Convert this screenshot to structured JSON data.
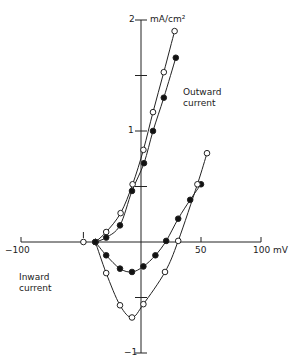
{
  "chart_data": {
    "type": "line",
    "title": "",
    "xlabel": "mV",
    "ylabel": "mA/cm2",
    "xlim": [
      -100,
      100
    ],
    "ylim": [
      -1,
      2
    ],
    "grid": false,
    "x_ticks": [
      {
        "value": -100,
        "label": "-100"
      },
      {
        "value": 50,
        "label": "50"
      },
      {
        "value": 100,
        "label": "100 mV"
      }
    ],
    "y_ticks": [
      {
        "value": 2,
        "label": "2"
      },
      {
        "value": 1.5,
        "label": ""
      },
      {
        "value": 1,
        "label": "1"
      },
      {
        "value": 0.5,
        "label": ""
      },
      {
        "value": -0.5,
        "label": ""
      },
      {
        "value": -1,
        "label": "-1"
      }
    ],
    "y_unit_label": "mA/cm²",
    "annotations": [
      {
        "text": "Outward",
        "line2": "current"
      },
      {
        "text": "Inward",
        "line2": "current"
      }
    ],
    "series": [
      {
        "name": "steady-state outward (open)",
        "marker": "open",
        "x": [
          -38,
          -29,
          -17,
          -7,
          2,
          10,
          19,
          28
        ],
        "y": [
          0,
          0.09,
          0.26,
          0.52,
          0.83,
          1.17,
          1.53,
          1.9
        ]
      },
      {
        "name": "steady-state outward (filled)",
        "marker": "filled",
        "x": [
          -38,
          -29,
          -17.5,
          -7.5,
          2.5,
          10,
          19,
          29
        ],
        "y": [
          0,
          0.04,
          0.15,
          0.46,
          0.71,
          1.0,
          1.3,
          1.66
        ]
      },
      {
        "name": "peak inward (filled)",
        "marker": "filled",
        "x": [
          -38,
          -29,
          -17.5,
          -7.5,
          2,
          12,
          21,
          31,
          41,
          50
        ],
        "y": [
          0,
          -0.12,
          -0.24,
          -0.27,
          -0.22,
          -0.12,
          0.01,
          0.21,
          0.38,
          0.52
        ]
      },
      {
        "name": "peak inward (open)",
        "marker": "open",
        "x": [
          -38,
          -29,
          -17.5,
          -7.5,
          2,
          20,
          31,
          47,
          55
        ],
        "y": [
          0,
          -0.28,
          -0.57,
          -0.68,
          -0.56,
          -0.27,
          0.01,
          0.52,
          0.8
        ]
      },
      {
        "name": "holding point",
        "marker": "open",
        "x": [
          -48
        ],
        "y": [
          0
        ]
      }
    ]
  },
  "labels": {
    "y_top": "2",
    "y_one": "1",
    "y_neg_one": "−1",
    "unit": "mA/cm²",
    "x_neg100": "−100",
    "x_50": "50",
    "x_100": "100 mV",
    "outward_1": "Outward",
    "outward_2": "current",
    "inward_1": "Inward",
    "inward_2": "current"
  }
}
